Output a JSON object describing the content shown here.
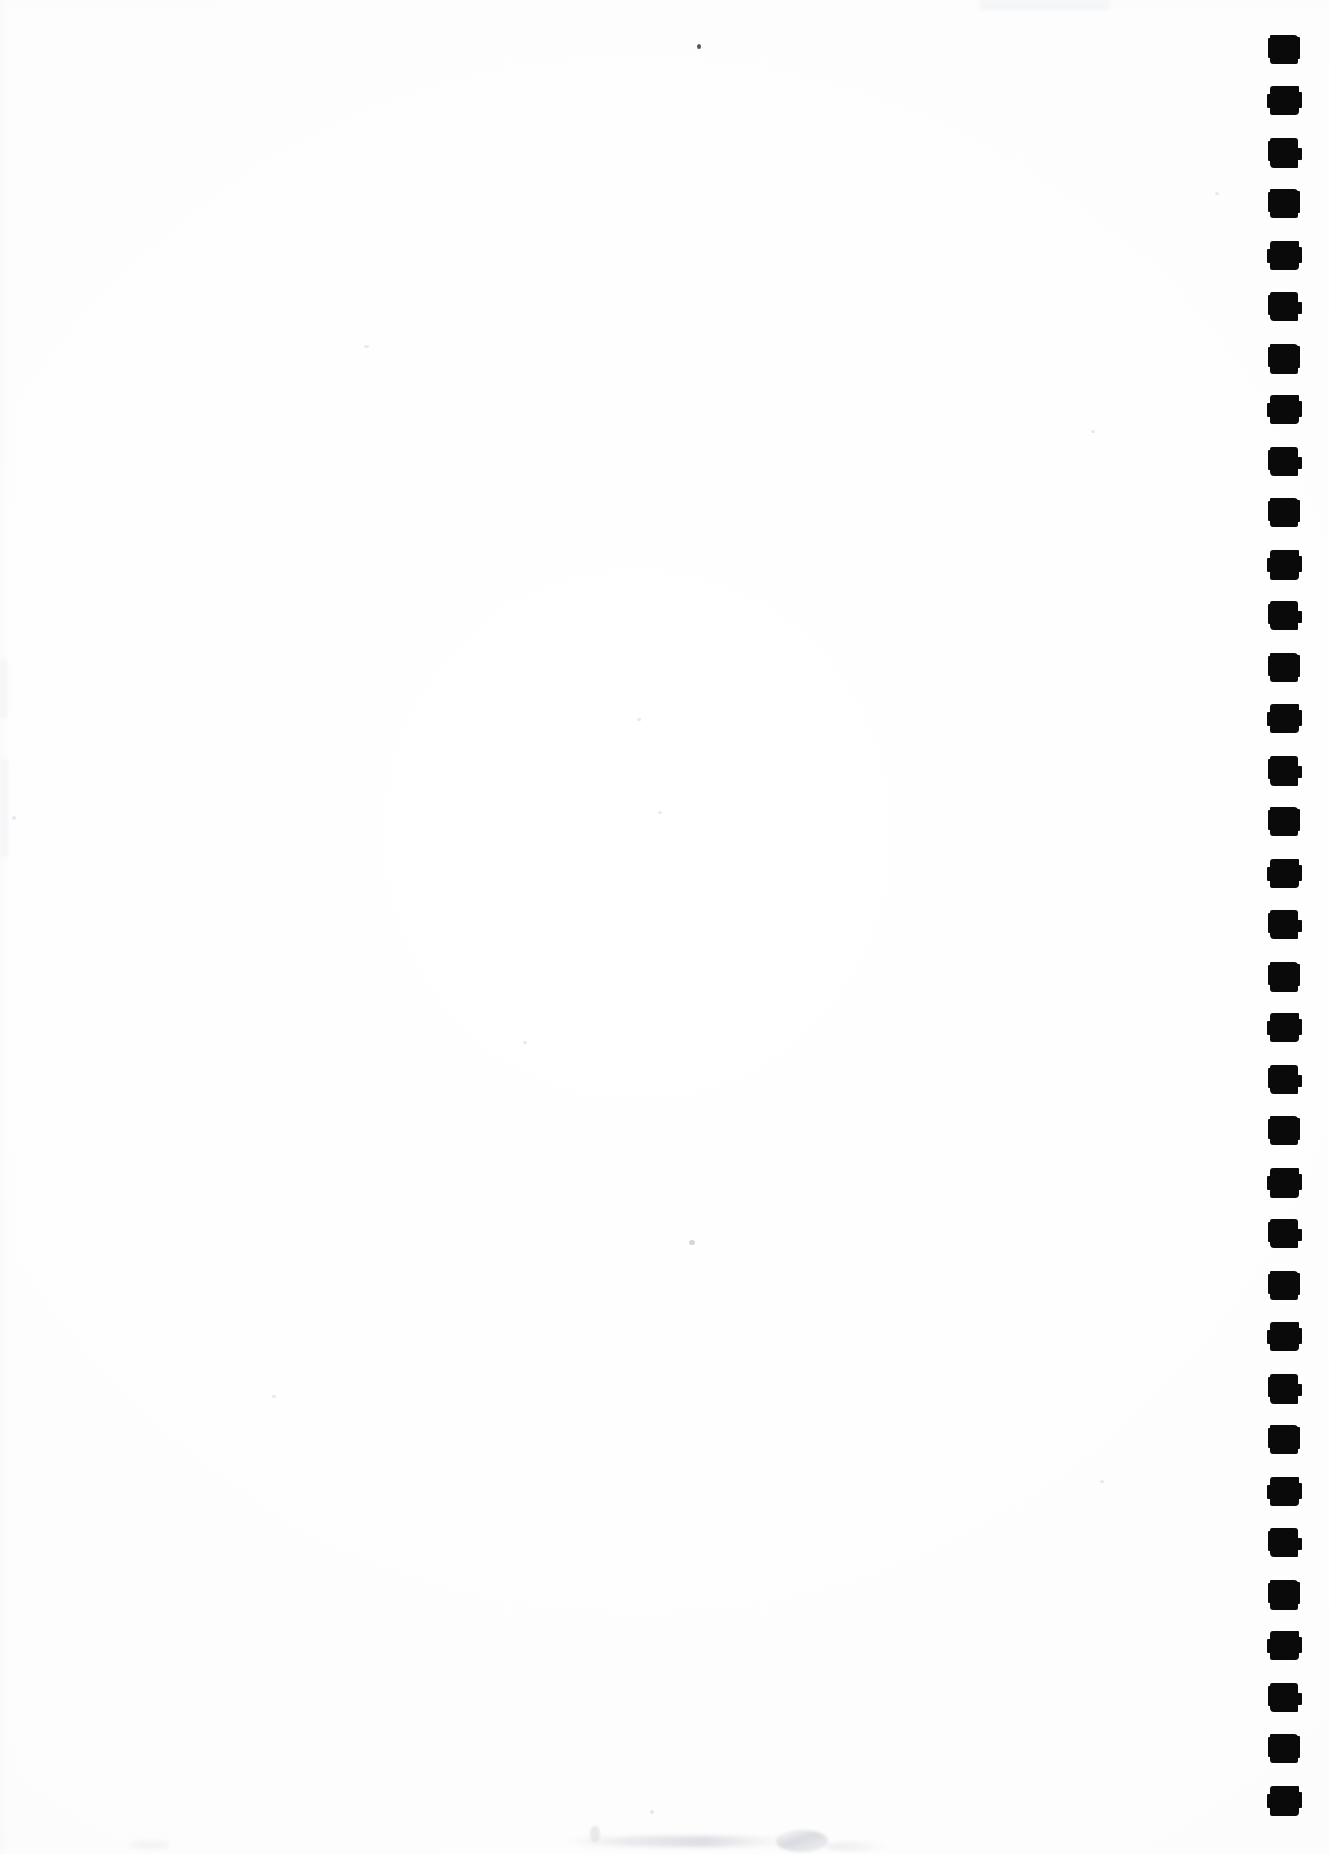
{
  "page": {
    "width_px": 1329,
    "height_px": 1854,
    "background_color": "#fefefe",
    "content_text": ""
  },
  "colors": {
    "paper": "#fefefe",
    "ink": "#0a0a0a",
    "speck_dark": "#28282c",
    "speck_faint": "#96989e",
    "smudge": "#d6d8dd"
  },
  "markers": {
    "name": "registration-marker-column",
    "shape": "square",
    "count": 35,
    "color": "#0a0a0a",
    "size_px": 28,
    "pitch_px": 51.5,
    "first_center_y": 49,
    "left_px": 1270,
    "positions_y": [
      35,
      86,
      138,
      189,
      241,
      292,
      344,
      395,
      447,
      498,
      550,
      601,
      653,
      704,
      756,
      807,
      859,
      910,
      962,
      1013,
      1065,
      1116,
      1168,
      1219,
      1271,
      1322,
      1374,
      1425,
      1477,
      1528,
      1580,
      1631,
      1683,
      1734,
      1786
    ]
  },
  "artifacts": {
    "specks": [
      {
        "name": "speck-top-center",
        "x": 697,
        "y": 44,
        "size": 4,
        "tone": "dark"
      },
      {
        "name": "speck-upper-left",
        "x": 364,
        "y": 345,
        "size": 4,
        "tone": "vfaint"
      },
      {
        "name": "speck-mid-left",
        "x": 12,
        "y": 816,
        "size": 3,
        "tone": "vfaint"
      },
      {
        "name": "speck-lower-center",
        "x": 689,
        "y": 1240,
        "size": 5,
        "tone": "faint"
      },
      {
        "name": "speck-bottom-center",
        "x": 650,
        "y": 1810,
        "size": 3,
        "tone": "vfaint"
      },
      {
        "name": "speck-upper-mid",
        "x": 637,
        "y": 718,
        "size": 3,
        "tone": "vfaint"
      },
      {
        "name": "speck-center",
        "x": 658,
        "y": 811,
        "size": 3,
        "tone": "vfaint"
      },
      {
        "name": "speck-right-upper",
        "x": 1091,
        "y": 430,
        "size": 3,
        "tone": "vfaint"
      },
      {
        "name": "speck-left-edge-a",
        "x": 4,
        "y": 660,
        "size": 3,
        "tone": "vfaint"
      },
      {
        "name": "speck-left-edge-b",
        "x": 5,
        "y": 768,
        "size": 3,
        "tone": "vfaint"
      },
      {
        "name": "speck-mid-right",
        "x": 523,
        "y": 1041,
        "size": 3,
        "tone": "vfaint"
      },
      {
        "name": "speck-upper-right",
        "x": 1215,
        "y": 192,
        "size": 3,
        "tone": "vfaint"
      }
    ],
    "smudges": [
      {
        "name": "bottom-edge-smudge",
        "position": "bottom-center"
      },
      {
        "name": "bottom-right-smudge",
        "position": "bottom-right"
      },
      {
        "name": "bottom-left-smudge",
        "position": "bottom-left"
      }
    ]
  }
}
